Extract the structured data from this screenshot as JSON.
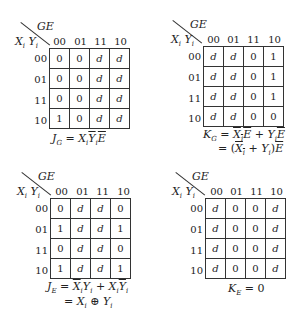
{
  "maps": [
    {
      "id": "JG",
      "col_var": "GE",
      "row_var_1": "X",
      "row_var_1_sub": "i",
      "row_var_2": "Y",
      "row_var_2_sub": "i",
      "col_labels": [
        "00",
        "01",
        "11",
        "10"
      ],
      "row_labels": [
        "00",
        "01",
        "11",
        "10"
      ],
      "cells": [
        [
          "0",
          "0",
          "d",
          "d"
        ],
        [
          "0",
          "0",
          "d",
          "d"
        ],
        [
          "0",
          "0",
          "d",
          "d"
        ],
        [
          "1",
          "0",
          "d",
          "d"
        ]
      ],
      "equation_lines": [
        "J_G = X_i Ȳ_i Ē"
      ]
    },
    {
      "id": "KG",
      "col_var": "GE",
      "row_var_1": "X",
      "row_var_1_sub": "i",
      "row_var_2": "Y",
      "row_var_2_sub": "i",
      "col_labels": [
        "00",
        "01",
        "11",
        "10"
      ],
      "row_labels": [
        "00",
        "01",
        "11",
        "10"
      ],
      "cells": [
        [
          "d",
          "d",
          "0",
          "1"
        ],
        [
          "d",
          "d",
          "0",
          "1"
        ],
        [
          "d",
          "d",
          "0",
          "1"
        ],
        [
          "d",
          "d",
          "0",
          "0"
        ]
      ],
      "equation_lines": [
        "K_G = X̄_i Ē + Y_i Ē",
        "= (X̄_i + Y_i) Ē"
      ]
    },
    {
      "id": "JE",
      "col_var": "GE",
      "row_var_1": "X",
      "row_var_1_sub": "i",
      "row_var_2": "Y",
      "row_var_2_sub": "i",
      "col_labels": [
        "00",
        "01",
        "11",
        "10"
      ],
      "row_labels": [
        "00",
        "01",
        "11",
        "10"
      ],
      "cells": [
        [
          "0",
          "d",
          "d",
          "0"
        ],
        [
          "1",
          "d",
          "d",
          "1"
        ],
        [
          "0",
          "d",
          "d",
          "0"
        ],
        [
          "1",
          "d",
          "d",
          "1"
        ]
      ],
      "equation_lines": [
        "J_E = X̄_i Y_i + X_i Ȳ_i",
        "= X_i ⊕ Y_i"
      ]
    },
    {
      "id": "KE",
      "col_var": "GE",
      "row_var_1": "X",
      "row_var_1_sub": "i",
      "row_var_2": "Y",
      "row_var_2_sub": "i",
      "col_labels": [
        "00",
        "01",
        "11",
        "10"
      ],
      "row_labels": [
        "00",
        "01",
        "11",
        "10"
      ],
      "cells": [
        [
          "d",
          "0",
          "0",
          "d"
        ],
        [
          "d",
          "0",
          "0",
          "d"
        ],
        [
          "d",
          "0",
          "0",
          "d"
        ],
        [
          "d",
          "0",
          "0",
          "d"
        ]
      ],
      "equation_lines": [
        "K_E = 0"
      ]
    }
  ],
  "eq": {
    "JG": {
      "lhs": "J",
      "lhs_sub": "G",
      "eqsign": "=",
      "t1": "X",
      "t1s": "i",
      "t2": "Y",
      "t2s": "i",
      "t3": "E"
    },
    "KG": {
      "lhs": "K",
      "lhs_sub": "G",
      "eqsign": "=",
      "a": "X",
      "as": "i",
      "b": "E",
      "plus": "+",
      "c": "Y",
      "cs": "i",
      "d": "E",
      "l2_eq": "=",
      "l2_open": "(",
      "l2_a": "X",
      "l2_as": "i",
      "l2_plus": "+",
      "l2_b": "Y",
      "l2_bs": "i",
      "l2_close": ")",
      "l2_c": "E"
    },
    "JE": {
      "lhs": "J",
      "lhs_sub": "E",
      "eqsign": "=",
      "a": "X",
      "as": "i",
      "b": "Y",
      "bs": "i",
      "plus": "+",
      "c": "X",
      "cs": "i",
      "d": "Y",
      "ds": "i",
      "l2_eq": "=",
      "l2_a": "X",
      "l2_as": "i",
      "l2_op": "⊕",
      "l2_b": "Y",
      "l2_bs": "i"
    },
    "KE": {
      "lhs": "K",
      "lhs_sub": "E",
      "eqsign": "=",
      "rhs": "0"
    }
  }
}
